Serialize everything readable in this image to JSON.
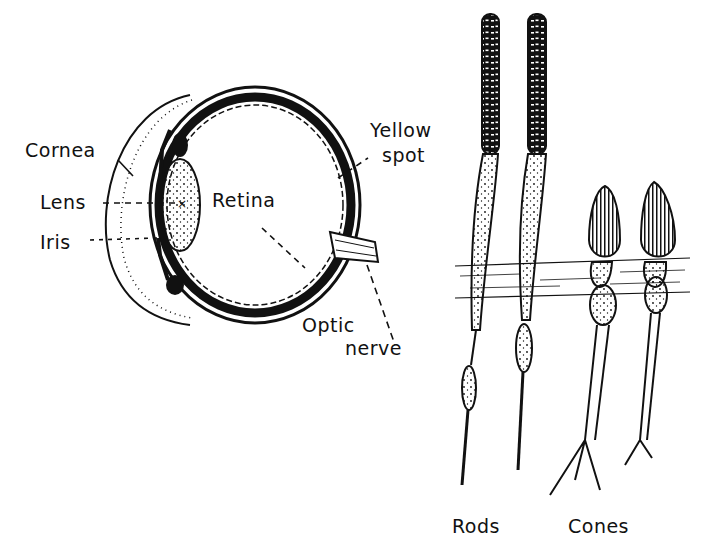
{
  "diagram": {
    "eye": {
      "labels": {
        "cornea": "Cornea",
        "lens": "Lens",
        "iris": "Iris",
        "retina": "Retina",
        "yellow_spot_line1": "Yellow",
        "yellow_spot_line2": "spot",
        "optic_nerve_line1": "Optic",
        "optic_nerve_line2": "nerve"
      }
    },
    "cells": {
      "labels": {
        "rods": "Rods",
        "cones": "Cones"
      }
    },
    "colors": {
      "ink": "#111111",
      "background": "#ffffff"
    }
  }
}
